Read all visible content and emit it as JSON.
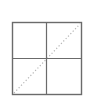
{
  "diagram": {
    "name": "grid-with-diagonal",
    "grid": {
      "rows": 2,
      "cols": 2
    },
    "diagonal": {
      "from": "bottom-left",
      "to": "top-right",
      "style": "dotted"
    },
    "colors": {
      "frame": "#6b6b6b",
      "diagonal": "#b5b5b5",
      "background": "#ffffff"
    }
  }
}
